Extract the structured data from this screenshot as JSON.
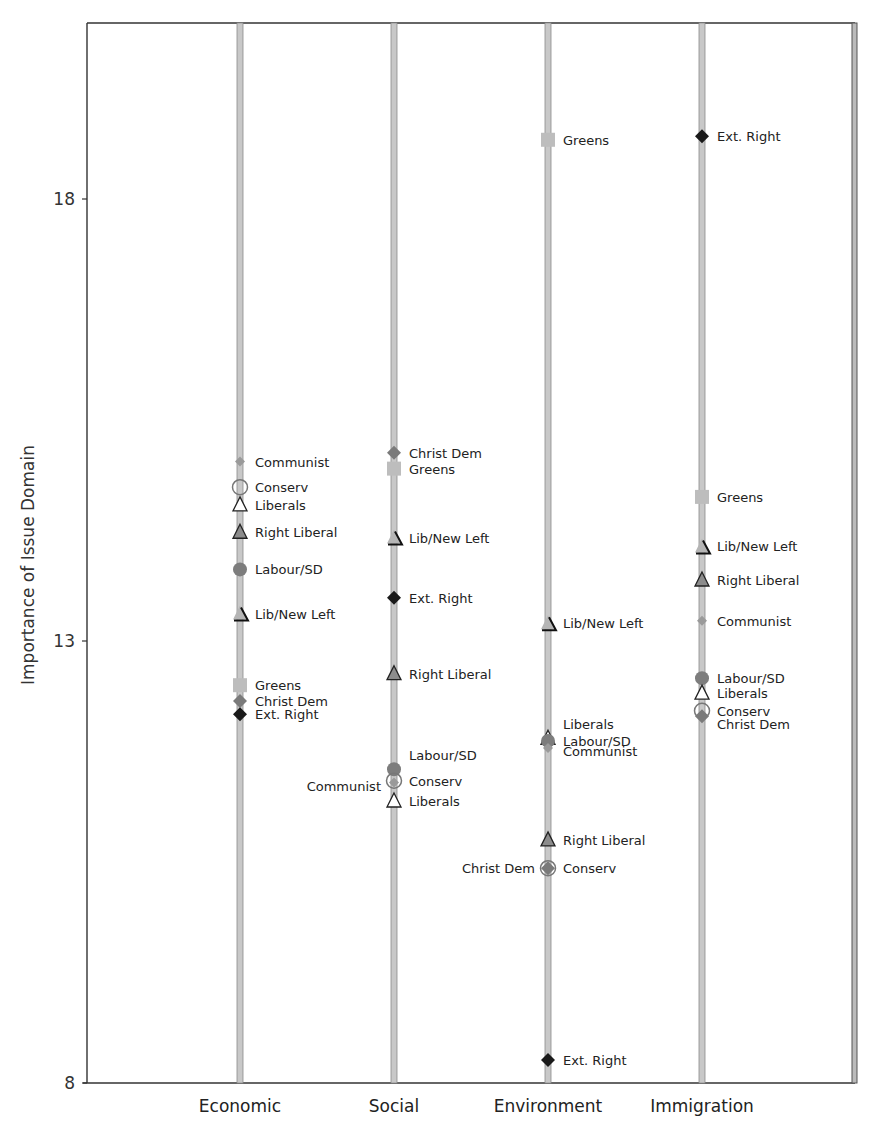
{
  "chart_data": {
    "type": "scatter",
    "title": "",
    "xlabel": "",
    "ylabel": "Importance of Issue Domain",
    "ylim": [
      8,
      19.9
    ],
    "yticks": [
      8,
      13,
      18
    ],
    "grid": false,
    "legend": "none (direct point labels)",
    "categories": [
      "Economic",
      "Social",
      "Environment",
      "Immigration"
    ],
    "marker_styles": {
      "Communist": {
        "shape": "diamond-small",
        "fill": "#9a9a9a",
        "stroke": "#9a9a9a"
      },
      "Conserv": {
        "shape": "circle-open",
        "fill": "#ffffff",
        "stroke": "#777777"
      },
      "Liberals": {
        "shape": "triangle",
        "fill": "#ffffff",
        "stroke": "#222222"
      },
      "Right Liberal": {
        "shape": "triangle",
        "fill": "#8c8c8c",
        "stroke": "#222222"
      },
      "Labour/SD": {
        "shape": "circle",
        "fill": "#7d7d7d",
        "stroke": "#7d7d7d"
      },
      "Lib/New Left": {
        "shape": "triangle-base",
        "fill": "#b5b5b5",
        "stroke": "#111111"
      },
      "Greens": {
        "shape": "square",
        "fill": "#bdbdbd",
        "stroke": "#bdbdbd"
      },
      "Christ Dem": {
        "shape": "diamond",
        "fill": "#7a7a7a",
        "stroke": "#7a7a7a"
      },
      "Ext. Right": {
        "shape": "diamond",
        "fill": "#1a1a1a",
        "stroke": "#1a1a1a"
      }
    },
    "series": [
      {
        "name": "Economic",
        "points": [
          {
            "party": "Communist",
            "value": 15.03,
            "label_side": "right",
            "dy": 0
          },
          {
            "party": "Conserv",
            "value": 14.74,
            "label_side": "right",
            "dy": 0
          },
          {
            "party": "Liberals",
            "value": 14.54,
            "label_side": "right",
            "dy": 0
          },
          {
            "party": "Right Liberal",
            "value": 14.23,
            "label_side": "right",
            "dy": 0
          },
          {
            "party": "Labour/SD",
            "value": 13.81,
            "label_side": "right",
            "dy": 0
          },
          {
            "party": "Lib/New Left",
            "value": 13.31,
            "label_side": "right",
            "dy": 0
          },
          {
            "party": "Greens",
            "value": 12.5,
            "label_side": "right",
            "dy": 0
          },
          {
            "party": "Christ Dem",
            "value": 12.32,
            "label_side": "right",
            "dy": 0
          },
          {
            "party": "Ext. Right",
            "value": 12.17,
            "label_side": "right",
            "dy": 0
          }
        ]
      },
      {
        "name": "Social",
        "points": [
          {
            "party": "Christ Dem",
            "value": 15.13,
            "label_side": "right",
            "dy": 0
          },
          {
            "party": "Greens",
            "value": 14.95,
            "label_side": "right",
            "dy": 0
          },
          {
            "party": "Lib/New Left",
            "value": 14.17,
            "label_side": "right",
            "dy": 0
          },
          {
            "party": "Ext. Right",
            "value": 13.49,
            "label_side": "right",
            "dy": 0
          },
          {
            "party": "Right Liberal",
            "value": 12.63,
            "label_side": "right",
            "dy": 0
          },
          {
            "party": "Labour/SD",
            "value": 11.55,
            "label_side": "right",
            "dy": -14
          },
          {
            "party": "Conserv",
            "value": 11.42,
            "label_side": "right",
            "dy": 0
          },
          {
            "party": "Communist",
            "value": 11.4,
            "label_side": "left",
            "dy": 4
          },
          {
            "party": "Liberals",
            "value": 11.19,
            "label_side": "right",
            "dy": 0
          }
        ]
      },
      {
        "name": "Environment",
        "points": [
          {
            "party": "Greens",
            "value": 18.67,
            "label_side": "right",
            "dy": 0
          },
          {
            "party": "Lib/New Left",
            "value": 13.2,
            "label_side": "right",
            "dy": 0
          },
          {
            "party": "Liberals",
            "value": 11.9,
            "label_side": "right",
            "dy": -14
          },
          {
            "party": "Labour/SD",
            "value": 11.87,
            "label_side": "right",
            "dy": 0
          },
          {
            "party": "Communist",
            "value": 11.79,
            "label_side": "right",
            "dy": 3
          },
          {
            "party": "Right Liberal",
            "value": 10.75,
            "label_side": "right",
            "dy": 0
          },
          {
            "party": "Conserv",
            "value": 10.43,
            "label_side": "right",
            "dy": 0
          },
          {
            "party": "Christ Dem",
            "value": 10.43,
            "label_side": "left",
            "dy": 0
          },
          {
            "party": "Ext. Right",
            "value": 8.26,
            "label_side": "right",
            "dy": 0
          }
        ]
      },
      {
        "name": "Immigration",
        "points": [
          {
            "party": "Ext. Right",
            "value": 18.71,
            "label_side": "right",
            "dy": 0
          },
          {
            "party": "Greens",
            "value": 14.63,
            "label_side": "right",
            "dy": 0
          },
          {
            "party": "Lib/New Left",
            "value": 14.07,
            "label_side": "right",
            "dy": 0
          },
          {
            "party": "Right Liberal",
            "value": 13.69,
            "label_side": "right",
            "dy": 0
          },
          {
            "party": "Communist",
            "value": 13.23,
            "label_side": "right",
            "dy": 0
          },
          {
            "party": "Labour/SD",
            "value": 12.58,
            "label_side": "right",
            "dy": 0
          },
          {
            "party": "Liberals",
            "value": 12.41,
            "label_side": "right",
            "dy": 0
          },
          {
            "party": "Conserv",
            "value": 12.21,
            "label_side": "right",
            "dy": 0
          },
          {
            "party": "Christ Dem",
            "value": 12.15,
            "label_side": "right",
            "dy": 8
          }
        ]
      }
    ]
  },
  "colors": {
    "axis": "#333333",
    "category_line_fill": "#c8c8c8",
    "category_line_edge": "#8a8a8a"
  }
}
